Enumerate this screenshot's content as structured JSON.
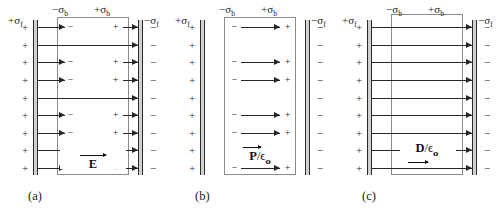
{
  "figure": {
    "type": "physics-diagram",
    "rows": 9,
    "broken_rows": [
      1,
      3,
      4,
      6,
      7,
      9
    ],
    "continuous_rows": [
      2,
      5,
      8
    ]
  },
  "labels": {
    "sigma_free_positive": "+σ",
    "sigma_free_positive_sub": "f",
    "sigma_bound_negative": "−σ",
    "sigma_bound_negative_sub": "b",
    "sigma_bound_positive": "+σ",
    "sigma_bound_positive_sub": "b",
    "sigma_free_negative": "−σ",
    "sigma_free_negative_sub": "f",
    "plate_charge_positive": "+",
    "plate_charge_negative": "−",
    "bound_charge_negative": "−",
    "bound_charge_positive": "+"
  },
  "panels": [
    {
      "id": "a",
      "caption": "(a)",
      "vector_label": "E",
      "vector_denominator": "",
      "field_style": "broken-at-dielectric",
      "arrows_outside": true,
      "arrows_inside": false,
      "bound_charges_shown": true
    },
    {
      "id": "b",
      "caption": "(b)",
      "vector_label": "P",
      "vector_denominator": "/ϵ",
      "vector_denominator_sub": "o",
      "field_style": "inside-dielectric-only",
      "arrows_outside": false,
      "arrows_inside": true,
      "bound_charges_shown": true
    },
    {
      "id": "c",
      "caption": "(c)",
      "vector_label": "D",
      "vector_denominator": "/ϵ",
      "vector_denominator_sub": "o",
      "field_style": "continuous-through",
      "arrows_outside": true,
      "arrows_inside": true,
      "bound_charges_shown": false
    }
  ],
  "colors": {
    "line": "#262626",
    "plate_fill": "#d0d0d0",
    "plate_border": "#2b2b2b",
    "slab_border": "#8a8a8a",
    "background": "#ffffff"
  }
}
